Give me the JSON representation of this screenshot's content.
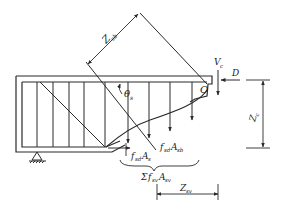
{
  "diagram": {
    "title": "",
    "colors": {
      "line": "#2a2a2a",
      "background": "#ffffff"
    },
    "labels": {
      "z_sv": {
        "main": "Z",
        "sub": "sb"
      },
      "theta": {
        "main": "θ",
        "sub": "s"
      },
      "vc": {
        "main": "V",
        "sub": "c"
      },
      "d": {
        "main": "D",
        "sub": ""
      },
      "o": {
        "main": "O",
        "sub": ""
      },
      "zc": {
        "main": "Z",
        "sub": "c"
      },
      "fsd_as": {
        "main": "f",
        "sub1": "sd",
        "mid": "A",
        "sub2": "s"
      },
      "fsd_asb": {
        "main": "f",
        "sub1": "sd",
        "mid": "A",
        "sub2": "sb"
      },
      "sum_fsv_asv": {
        "sigma": "Σ",
        "main": "f",
        "sub1": "sv",
        "mid": "A",
        "sub2": "sv"
      },
      "z_sv_bottom": {
        "main": "Z",
        "sub": "sv"
      }
    },
    "elements": [
      "beam-outline",
      "stirrups",
      "inclined-bent-bar",
      "diagonal-crack",
      "support-pin",
      "compression-zone",
      "force-arrows",
      "dimension-lines"
    ]
  }
}
